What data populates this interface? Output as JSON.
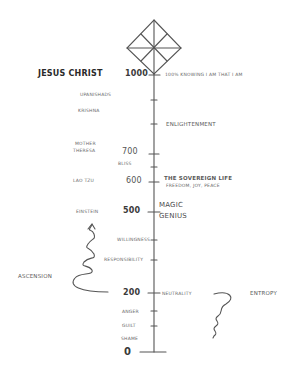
{
  "diagram": {
    "type": "hand-drawn consciousness scale",
    "axis": {
      "ticks": [
        {
          "value": "1000",
          "left_label": "Jesus Christ",
          "right_label": "100% Knowing I Am That I Am"
        },
        {
          "value": "",
          "left_label": "Upanishads",
          "right_label": ""
        },
        {
          "value": "",
          "left_label": "Krishna",
          "right_label": ""
        },
        {
          "value": "",
          "left_label": "",
          "right_label": "Enlightenment"
        },
        {
          "value": "700",
          "left_label": "Mother Theresa",
          "right_label": ""
        },
        {
          "value": "",
          "left_label": "Bliss",
          "right_label": ""
        },
        {
          "value": "600",
          "left_label": "Lao Tzu",
          "right_label": "The Sovereign Life",
          "right_sublabel": "Freedom, Joy, Peace"
        },
        {
          "value": "500",
          "left_label": "Einstein",
          "right_label": "Magic",
          "right_label_2": "Genius"
        },
        {
          "value": "",
          "left_label": "Willingness",
          "right_label": ""
        },
        {
          "value": "",
          "left_label": "Responsibility",
          "right_label": ""
        },
        {
          "value": "200",
          "left_label": "",
          "right_label": "Neutrality"
        },
        {
          "value": "",
          "left_label": "Anger",
          "right_label": ""
        },
        {
          "value": "",
          "left_label": "Guilt",
          "right_label": ""
        },
        {
          "value": "",
          "left_label": "Shame",
          "right_label": ""
        },
        {
          "value": "0",
          "left_label": "",
          "right_label": ""
        }
      ]
    },
    "side_labels": {
      "left": "Ascension",
      "right": "Entropy"
    },
    "top_symbol": "diamond-star"
  },
  "labels": {
    "jesus": "Jesus Christ",
    "v1000": "1000",
    "knowing": "100% Knowing I Am That I Am",
    "upanishads": "Upanishads",
    "krishna": "Krishna",
    "enlightenment": "Enlightenment",
    "mother": "Mother",
    "theresa": "Theresa",
    "v700": "700",
    "bliss": "Bliss",
    "laotzu": "Lao Tzu",
    "v600": "600",
    "sovereign": "The Sovereign Life",
    "freedom": "Freedom, Joy, Peace",
    "einstein": "Einstein",
    "v500": "500",
    "magic": "Magic",
    "genius": "Genius",
    "willingness": "Willingness",
    "responsibility": "Responsibility",
    "ascension": "Ascension",
    "v200": "200",
    "neutrality": "Neutrality",
    "entropy": "Entropy",
    "anger": "Anger",
    "guilt": "Guilt",
    "shame": "Shame",
    "v0": "0"
  }
}
